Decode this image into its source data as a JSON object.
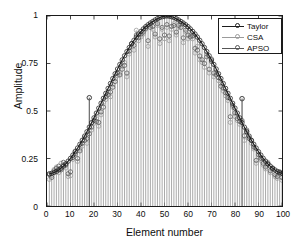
{
  "chart_data": {
    "type": "line",
    "title": "",
    "xlabel": "Element number",
    "ylabel": "Amplitude",
    "xlim": [
      0,
      100
    ],
    "ylim": [
      0,
      1
    ],
    "xticks": [
      0,
      10,
      20,
      30,
      40,
      50,
      60,
      70,
      80,
      90,
      100
    ],
    "xticklabels": [
      "0",
      "10",
      "20",
      "30",
      "40",
      "50",
      "60",
      "70",
      "80",
      "90",
      "100"
    ],
    "yticks": [
      0,
      0.25,
      0.5,
      0.75,
      1
    ],
    "yticklabels": [
      "0",
      "0.25",
      "0.5",
      "0.75",
      "1"
    ],
    "grid": false,
    "legend_position": "upper right",
    "marker": "circle",
    "stems": true,
    "x": [
      1,
      2,
      3,
      4,
      5,
      6,
      7,
      8,
      9,
      10,
      11,
      12,
      13,
      14,
      15,
      16,
      17,
      18,
      19,
      20,
      21,
      22,
      23,
      24,
      25,
      26,
      27,
      28,
      29,
      30,
      31,
      32,
      33,
      34,
      35,
      36,
      37,
      38,
      39,
      40,
      41,
      42,
      43,
      44,
      45,
      46,
      47,
      48,
      49,
      50,
      51,
      52,
      53,
      54,
      55,
      56,
      57,
      58,
      59,
      60,
      61,
      62,
      63,
      64,
      65,
      66,
      67,
      68,
      69,
      70,
      71,
      72,
      73,
      74,
      75,
      76,
      77,
      78,
      79,
      80,
      81,
      82,
      83,
      84,
      85,
      86,
      87,
      88,
      89,
      90,
      91,
      92,
      93,
      94,
      95,
      96,
      97,
      98,
      99,
      100
    ],
    "series": [
      {
        "name": "Taylor",
        "color": "#1c1c1c",
        "values": [
          0.17,
          0.172,
          0.176,
          0.182,
          0.19,
          0.199,
          0.21,
          0.222,
          0.236,
          0.251,
          0.268,
          0.286,
          0.305,
          0.325,
          0.346,
          0.368,
          0.391,
          0.415,
          0.439,
          0.464,
          0.489,
          0.515,
          0.541,
          0.567,
          0.593,
          0.619,
          0.645,
          0.671,
          0.696,
          0.721,
          0.745,
          0.769,
          0.791,
          0.813,
          0.834,
          0.854,
          0.872,
          0.889,
          0.905,
          0.919,
          0.932,
          0.944,
          0.954,
          0.963,
          0.971,
          0.979,
          0.986,
          0.992,
          0.996,
          0.999,
          1.0,
          0.999,
          0.996,
          0.992,
          0.986,
          0.979,
          0.971,
          0.963,
          0.954,
          0.944,
          0.932,
          0.919,
          0.905,
          0.889,
          0.872,
          0.854,
          0.834,
          0.813,
          0.791,
          0.769,
          0.745,
          0.721,
          0.696,
          0.671,
          0.645,
          0.619,
          0.593,
          0.567,
          0.541,
          0.515,
          0.489,
          0.464,
          0.439,
          0.415,
          0.391,
          0.368,
          0.346,
          0.325,
          0.305,
          0.286,
          0.268,
          0.251,
          0.236,
          0.222,
          0.21,
          0.199,
          0.19,
          0.182,
          0.176,
          0.172
        ]
      },
      {
        "name": "CSA",
        "color": "#9a9a9a",
        "values": [
          0.14,
          0.16,
          0.192,
          0.205,
          0.175,
          0.225,
          0.218,
          0.2,
          0.155,
          0.16,
          0.245,
          0.29,
          0.235,
          0.3,
          0.315,
          0.36,
          0.33,
          0.57,
          0.4,
          0.435,
          0.46,
          0.42,
          0.48,
          0.545,
          0.56,
          0.6,
          0.575,
          0.64,
          0.67,
          0.685,
          0.7,
          0.735,
          0.755,
          0.68,
          0.8,
          0.84,
          0.82,
          0.925,
          0.87,
          0.89,
          0.905,
          0.93,
          0.84,
          0.95,
          0.93,
          0.89,
          0.95,
          0.855,
          0.93,
          0.88,
          0.94,
          0.87,
          0.93,
          0.96,
          0.9,
          0.94,
          0.955,
          0.86,
          0.915,
          0.88,
          0.9,
          0.88,
          0.805,
          0.84,
          0.77,
          0.755,
          0.73,
          0.8,
          0.7,
          0.775,
          0.68,
          0.7,
          0.66,
          0.645,
          0.605,
          0.58,
          0.555,
          0.44,
          0.52,
          0.47,
          0.45,
          0.43,
          0.565,
          0.345,
          0.39,
          0.36,
          0.33,
          0.3,
          0.225,
          0.26,
          0.24,
          0.215,
          0.195,
          0.23,
          0.175,
          0.2,
          0.155,
          0.145,
          0.17,
          0.135
        ]
      },
      {
        "name": "APSO",
        "color": "#555555",
        "values": [
          0.165,
          0.15,
          0.185,
          0.198,
          0.21,
          0.19,
          0.23,
          0.215,
          0.17,
          0.18,
          0.255,
          0.275,
          0.25,
          0.29,
          0.33,
          0.345,
          0.355,
          0.38,
          0.415,
          0.45,
          0.445,
          0.44,
          0.495,
          0.52,
          0.575,
          0.585,
          0.6,
          0.625,
          0.655,
          0.7,
          0.69,
          0.72,
          0.74,
          0.7,
          0.815,
          0.855,
          0.845,
          0.9,
          0.885,
          0.905,
          0.915,
          0.935,
          0.87,
          0.94,
          0.945,
          0.905,
          0.96,
          0.88,
          0.94,
          0.9,
          0.955,
          0.895,
          0.945,
          0.95,
          0.915,
          0.95,
          0.94,
          0.885,
          0.925,
          0.9,
          0.89,
          0.895,
          0.83,
          0.82,
          0.79,
          0.77,
          0.75,
          0.785,
          0.72,
          0.76,
          0.7,
          0.69,
          0.675,
          0.63,
          0.62,
          0.595,
          0.57,
          0.47,
          0.53,
          0.49,
          0.46,
          0.445,
          0.45,
          0.37,
          0.4,
          0.355,
          0.345,
          0.31,
          0.24,
          0.27,
          0.25,
          0.225,
          0.205,
          0.22,
          0.185,
          0.195,
          0.165,
          0.155,
          0.18,
          0.15
        ]
      }
    ],
    "annotations": [
      {
        "text": "outlier",
        "x": 18,
        "y": 0.57
      },
      {
        "text": "outlier",
        "x": 83,
        "y": 0.565
      }
    ]
  },
  "legend": {
    "items": [
      {
        "label": "Taylor"
      },
      {
        "label": "CSA"
      },
      {
        "label": "APSO"
      }
    ]
  },
  "axes": {
    "ylabel": "Amplitude",
    "xlabel": "Element number"
  },
  "colors": {
    "axis": "#1a1a1a",
    "taylor": "#1c1c1c",
    "csa": "#9a9a9a",
    "apso": "#555555",
    "stem": "#8c8c8c",
    "background": "#ffffff"
  }
}
